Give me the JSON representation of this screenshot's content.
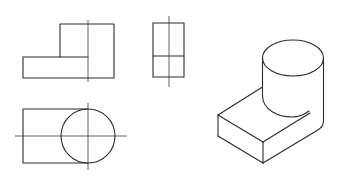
{
  "figure": {
    "type": "orthographic-projection-with-isometric",
    "background": "#ffffff",
    "line_color": "#2b2b2b",
    "views": [
      {
        "name": "front-view",
        "description": "L-shaped profile: low base slab on the left, tall block on the right, vertical centerline"
      },
      {
        "name": "side-view",
        "description": "Rectangle divided by a horizontal line, vertical centerline"
      },
      {
        "name": "top-view",
        "description": "Rectangle with a circle overlapping its right end, horizontal and vertical centerlines"
      },
      {
        "name": "isometric-view",
        "description": "3D solid: rectangular base slab with an upright cylinder at the back-right corner"
      }
    ]
  }
}
